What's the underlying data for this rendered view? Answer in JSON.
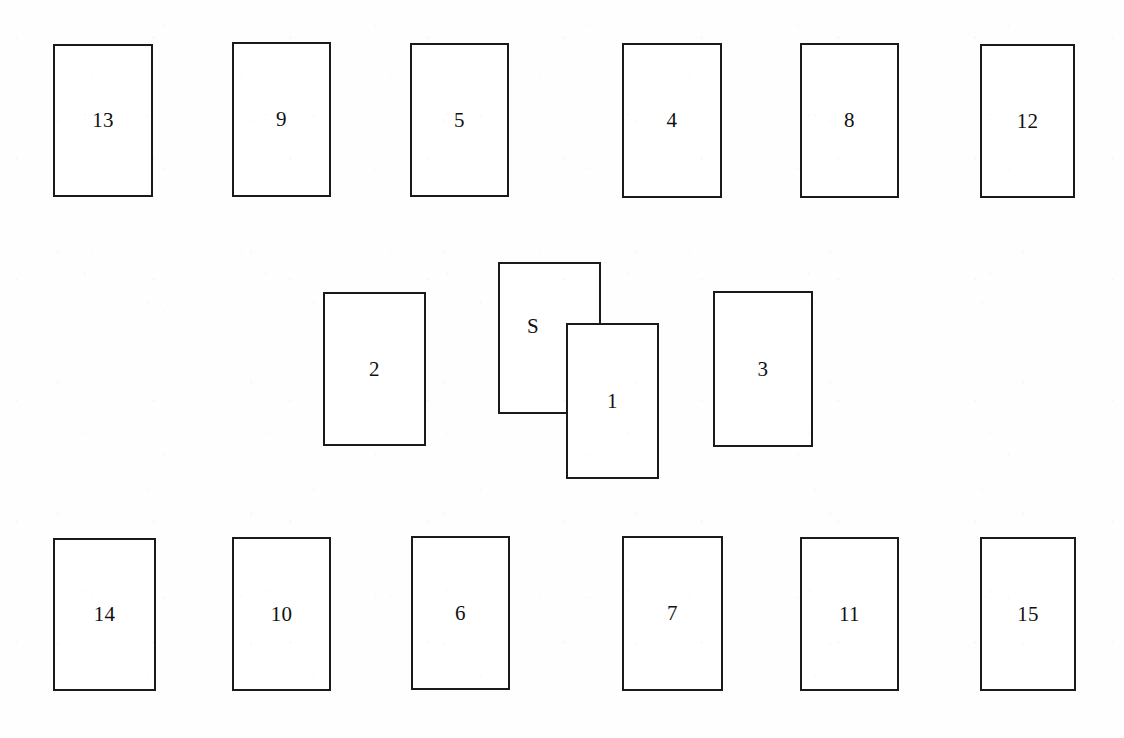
{
  "diagram": {
    "background_color": "#fefefe",
    "card_border_color": "#1a1a1a",
    "card_fill_color": "#ffffff",
    "label_color": "#111111",
    "canvas": {
      "width": 1124,
      "height": 738
    }
  },
  "rows": {
    "top_row": {
      "name": "top-row",
      "y": 44,
      "card_width": 99,
      "card_height": 153
    },
    "middle_row": {
      "name": "middle-row",
      "y": 292,
      "card_width": 100,
      "card_height": 154
    },
    "bottom_row": {
      "name": "bottom-row",
      "y": 537,
      "card_width": 99,
      "card_height": 153
    }
  },
  "cards": [
    {
      "id": "card-13",
      "label": "13",
      "row": "top",
      "x": 53,
      "y": 44,
      "w": 100,
      "h": 153,
      "stack": "flat"
    },
    {
      "id": "card-9",
      "label": "9",
      "row": "top",
      "x": 232,
      "y": 42,
      "w": 99,
      "h": 155,
      "stack": "flat"
    },
    {
      "id": "card-5",
      "label": "5",
      "row": "top",
      "x": 410,
      "y": 43,
      "w": 99,
      "h": 154,
      "stack": "flat"
    },
    {
      "id": "card-4",
      "label": "4",
      "row": "top",
      "x": 622,
      "y": 43,
      "w": 100,
      "h": 155,
      "stack": "flat"
    },
    {
      "id": "card-8",
      "label": "8",
      "row": "top",
      "x": 800,
      "y": 43,
      "w": 99,
      "h": 155,
      "stack": "flat"
    },
    {
      "id": "card-12",
      "label": "12",
      "row": "top",
      "x": 980,
      "y": 44,
      "w": 95,
      "h": 154,
      "stack": "flat"
    },
    {
      "id": "card-2",
      "label": "2",
      "row": "middle",
      "x": 323,
      "y": 292,
      "w": 103,
      "h": 154,
      "stack": "flat"
    },
    {
      "id": "card-S",
      "label": "S",
      "row": "middle",
      "x": 498,
      "y": 262,
      "w": 103,
      "h": 152,
      "stack": "behind"
    },
    {
      "id": "card-1",
      "label": "1",
      "row": "middle",
      "x": 566,
      "y": 323,
      "w": 93,
      "h": 156,
      "stack": "front"
    },
    {
      "id": "card-3",
      "label": "3",
      "row": "middle",
      "x": 713,
      "y": 291,
      "w": 100,
      "h": 156,
      "stack": "flat"
    },
    {
      "id": "card-14",
      "label": "14",
      "row": "bottom",
      "x": 53,
      "y": 538,
      "w": 103,
      "h": 153,
      "stack": "flat"
    },
    {
      "id": "card-10",
      "label": "10",
      "row": "bottom",
      "x": 232,
      "y": 537,
      "w": 99,
      "h": 154,
      "stack": "flat"
    },
    {
      "id": "card-6",
      "label": "6",
      "row": "bottom",
      "x": 411,
      "y": 536,
      "w": 99,
      "h": 154,
      "stack": "flat"
    },
    {
      "id": "card-7",
      "label": "7",
      "row": "bottom",
      "x": 622,
      "y": 536,
      "w": 101,
      "h": 155,
      "stack": "flat"
    },
    {
      "id": "card-11",
      "label": "11",
      "row": "bottom",
      "x": 800,
      "y": 537,
      "w": 99,
      "h": 154,
      "stack": "flat"
    },
    {
      "id": "card-15",
      "label": "15",
      "row": "bottom",
      "x": 980,
      "y": 537,
      "w": 96,
      "h": 154,
      "stack": "flat"
    }
  ]
}
